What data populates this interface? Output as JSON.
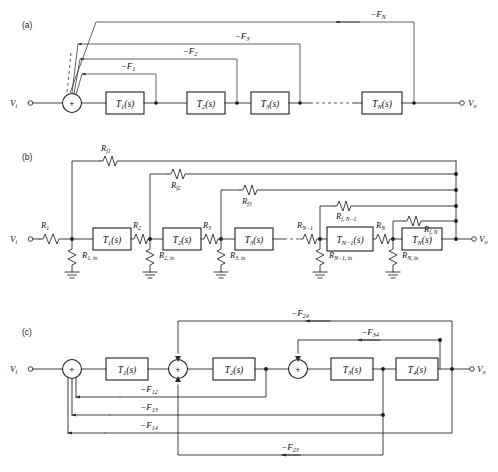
{
  "figure": {
    "width": 498,
    "height": 472,
    "background": "#ffffff",
    "line_color": "#2b2b2b"
  },
  "panels": [
    {
      "id": "a",
      "label": "(a)",
      "description": "Cascade of N transfer-function blocks with individual feedback paths to a single summing junction",
      "input_label": "V",
      "input_sub": "i",
      "output_label": "V",
      "output_sub": "o",
      "summer_sign": "+",
      "blocks": [
        {
          "name": "T",
          "sub": "1",
          "suffix": "(s)"
        },
        {
          "name": "T",
          "sub": "2",
          "suffix": "(s)"
        },
        {
          "name": "T",
          "sub": "3",
          "suffix": "(s)"
        },
        {
          "name": "T",
          "sub": "N",
          "suffix": "(s)"
        }
      ],
      "feedback_paths": [
        {
          "label": "−F",
          "sub": "1"
        },
        {
          "label": "−F",
          "sub": "2"
        },
        {
          "label": "−F",
          "sub": "3"
        },
        {
          "label": "−F",
          "sub": "N"
        }
      ],
      "ellipsis": "dashed-line-between-T3-and-TN"
    },
    {
      "id": "b",
      "label": "(b)",
      "description": "Resistive realization: series input resistors, shunt input resistances to ground, and feedback resistors from output bus",
      "input_label": "V",
      "input_sub": "i",
      "output_label": "V",
      "output_sub": "o",
      "blocks": [
        {
          "name": "T",
          "sub": "1",
          "suffix": "(s)"
        },
        {
          "name": "T",
          "sub": "2",
          "suffix": "(s)"
        },
        {
          "name": "T",
          "sub": "3",
          "suffix": "(s)"
        },
        {
          "name": "T",
          "sub": "N−1",
          "suffix": "(s)"
        },
        {
          "name": "T",
          "sub": "N",
          "suffix": "(s)"
        }
      ],
      "series_resistors": [
        {
          "name": "R",
          "sub": "1"
        },
        {
          "name": "R",
          "sub": "2"
        },
        {
          "name": "R",
          "sub": "3"
        },
        {
          "name": "R",
          "sub": "N−1"
        },
        {
          "name": "R",
          "sub": "N"
        }
      ],
      "shunt_resistors": [
        {
          "name": "R",
          "sub": "1, in"
        },
        {
          "name": "R",
          "sub": "2, in"
        },
        {
          "name": "R",
          "sub": "3, in"
        },
        {
          "name": "R",
          "sub": "N−1, in"
        },
        {
          "name": "R",
          "sub": "N, in"
        }
      ],
      "feedback_resistors": [
        {
          "name": "R",
          "sub": "f1"
        },
        {
          "name": "R",
          "sub": "f2"
        },
        {
          "name": "R",
          "sub": "f3"
        },
        {
          "name": "R",
          "sub": "f, N−1"
        },
        {
          "name": "R",
          "sub": "f, N"
        }
      ],
      "ground_symbol": "earth-ground",
      "ellipsis": "dashed-line-between-T3-and-RN-1"
    },
    {
      "id": "c",
      "label": "(c)",
      "description": "Four-block cascade with three summing junctions and six named feedback paths",
      "input_label": "V",
      "input_sub": "i",
      "output_label": "V",
      "output_sub": "o",
      "summer_signs": [
        "+",
        "+",
        "+"
      ],
      "blocks": [
        {
          "name": "T",
          "sub": "1",
          "suffix": "(s)"
        },
        {
          "name": "T",
          "sub": "2",
          "suffix": "(s)"
        },
        {
          "name": "T",
          "sub": "3",
          "suffix": "(s)"
        },
        {
          "name": "T",
          "sub": "4",
          "suffix": "(s)"
        }
      ],
      "feedback_paths": [
        {
          "label": "−F",
          "sub": "24",
          "position": "top-outer"
        },
        {
          "label": "−F",
          "sub": "34",
          "position": "top-inner"
        },
        {
          "label": "−F",
          "sub": "12",
          "position": "bottom-1"
        },
        {
          "label": "−F",
          "sub": "13",
          "position": "bottom-2"
        },
        {
          "label": "−F",
          "sub": "14",
          "position": "bottom-3"
        },
        {
          "label": "−F",
          "sub": "23",
          "position": "bottom-4"
        }
      ]
    }
  ]
}
